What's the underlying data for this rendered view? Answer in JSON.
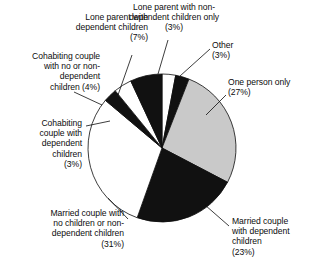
{
  "chart_data": {
    "type": "pie",
    "title": "",
    "subtitle": "",
    "xlabel": "",
    "ylabel": "",
    "legend_position": "none",
    "grid": false,
    "units": "percent",
    "categories": [
      "Lone parent with non-dependent children only",
      "Other",
      "One person only",
      "Married couple with dependent children",
      "Married couple with no children or non-dependent children",
      "Cohabiting couple with dependent children",
      "Cohabiting couple with no or non-dependent children",
      "Lone parent with dependent children"
    ],
    "values": [
      3,
      3,
      27,
      23,
      31,
      3,
      4,
      7
    ],
    "slice_colors": [
      "#ffffff",
      "#111111",
      "#c9c9c9",
      "#111111",
      "#ffffff",
      "#111111",
      "#ffffff",
      "#111111"
    ],
    "start_angle_deg": 0,
    "direction": "clockwise"
  },
  "labels": {
    "lone_parent_dependent": "Lone parent with\ndependent children\n(7%)",
    "lone_parent_non_dependent": "Lone parent with non-\ndependent children only\n(3%)",
    "other": "Other\n(3%)",
    "one_person_only": "One person only\n(27%)",
    "married_dependent": "Married couple\nwith dependent\nchildren\n(23%)",
    "married_no_children": "Married couple with\nno children or non-\ndependent children\n(31%)",
    "cohabiting_dependent": "Cohabiting\ncouple with\ndependent\nchildren\n(3%)",
    "cohabiting_non_dependent": "Cohabiting couple\nwith no or non-\ndependent\nchildren (4%)"
  },
  "colors": {
    "slice_dark": "#111111",
    "slice_light": "#ffffff",
    "slice_gray": "#c9c9c9",
    "outline": "#0d0d0d",
    "background": "#ffffff",
    "text": "#0d0d0d"
  }
}
